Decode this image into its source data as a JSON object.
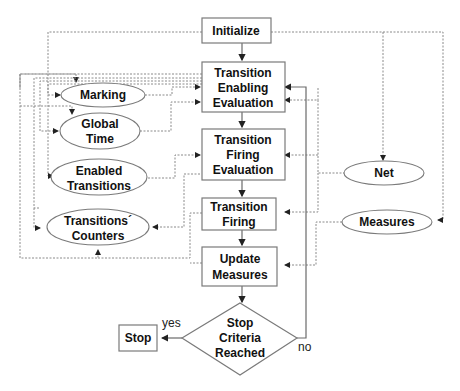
{
  "diagram": {
    "type": "flowchart",
    "processes": {
      "initialize": [
        "Initialize"
      ],
      "enabling": [
        "Transition",
        "Enabling",
        "Evaluation"
      ],
      "firing_eval": [
        "Transition",
        "Firing",
        "Evaluation"
      ],
      "firing": [
        "Transition",
        "Firing"
      ],
      "update": [
        "Update",
        "Measures"
      ],
      "stop": [
        "Stop"
      ]
    },
    "decision": [
      "Stop",
      "Criteria",
      "Reached"
    ],
    "data_stores": {
      "marking": [
        "Marking"
      ],
      "global_time": [
        "Global",
        "Time"
      ],
      "enabled_transitions": [
        "Enabled",
        "Transitions"
      ],
      "counters": [
        "Transitions´",
        "Counters"
      ],
      "net": [
        "Net"
      ],
      "measures": [
        "Measures"
      ]
    },
    "edge_labels": {
      "yes": "yes",
      "no": "no"
    }
  }
}
